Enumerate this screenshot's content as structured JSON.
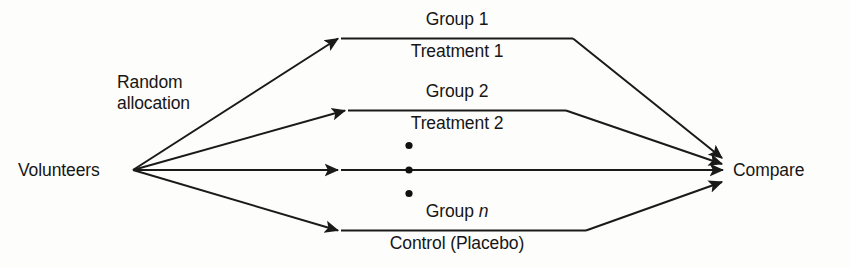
{
  "diagram": {
    "type": "flow",
    "colors": {
      "background": "#fdfdfb",
      "line": "#1a1a1a",
      "text": "#161616"
    },
    "source_node": {
      "label": "Volunteers"
    },
    "allocation_label": {
      "line1": "Random",
      "line2": "allocation"
    },
    "sink_node": {
      "label": "Compare"
    },
    "branches": [
      {
        "group_label": "Group 1",
        "treatment_label": "Treatment 1",
        "group_label_italic_suffix": ""
      },
      {
        "group_label": "Group 2",
        "treatment_label": "Treatment 2",
        "group_label_italic_suffix": ""
      },
      {
        "group_label": "Group",
        "treatment_label": "",
        "group_label_italic_suffix": "n"
      }
    ],
    "ellipsis": {
      "glyph": "•",
      "count": 3
    },
    "last_branch": {
      "group_prefix": "Group",
      "group_italic": "n",
      "treatment_label": "Control (Placebo)"
    }
  }
}
